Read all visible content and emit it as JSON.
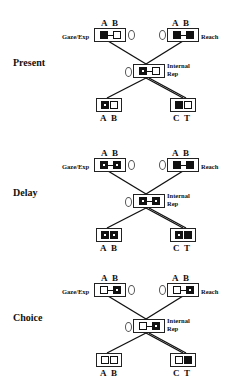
{
  "panels": [
    {
      "phase": "Present",
      "gaze": {
        "label": "Gaze/Exp",
        "letters": [
          "A",
          "B"
        ],
        "cells": [
          "filled",
          "hollow"
        ],
        "connected": true
      },
      "reach": {
        "label": "Reach",
        "letters": [
          "A",
          "B"
        ],
        "cells": [
          "filled",
          "filled"
        ],
        "connected": true
      },
      "internal": {
        "label_line1": "Internal",
        "label_line2": "Rep",
        "cells": [
          "filled-dot",
          "hollow"
        ],
        "connected": true
      },
      "bottom_left": {
        "letters": [
          "A",
          "B"
        ],
        "cells": [
          "filled-dot",
          "hollow"
        ]
      },
      "bottom_right": {
        "letters": [
          "C",
          "T"
        ],
        "cells": [
          "filled",
          "hollow"
        ]
      }
    },
    {
      "phase": "Delay",
      "gaze": {
        "label": "Gaze/Exp",
        "letters": [
          "A",
          "B"
        ],
        "cells": [
          "filled-dot",
          "filled-dot"
        ],
        "connected": true
      },
      "reach": {
        "label": "Reach",
        "letters": [
          "A",
          "B"
        ],
        "cells": [
          "filled",
          "filled"
        ],
        "connected": true
      },
      "internal": {
        "label_line1": "Internal",
        "label_line2": "Rep",
        "cells": [
          "filled-dot",
          "filled-dot"
        ],
        "connected": true
      },
      "bottom_left": {
        "letters": [
          "A",
          "B"
        ],
        "cells": [
          "filled-dot",
          "filled-dot"
        ]
      },
      "bottom_right": {
        "letters": [
          "C",
          "T"
        ],
        "cells": [
          "filled-dot",
          "filled"
        ]
      }
    },
    {
      "phase": "Choice",
      "gaze": {
        "label": "Gaze/Exp",
        "letters": [
          "A",
          "B"
        ],
        "cells": [
          "hollow",
          "filled-dot"
        ],
        "connected": true
      },
      "reach": {
        "label": "Reach",
        "letters": [
          "A",
          "B"
        ],
        "cells": [
          "hollow",
          "filled-dot"
        ],
        "connected": true
      },
      "internal": {
        "label_line1": "Internal",
        "label_line2": "Rep",
        "cells": [
          "hollow",
          "filled-dot"
        ],
        "connected": true
      },
      "bottom_left": {
        "letters": [
          "A",
          "B"
        ],
        "cells": [
          "hollow",
          "hollow"
        ]
      },
      "bottom_right": {
        "letters": [
          "C",
          "T"
        ],
        "cells": [
          "hollow",
          "filled"
        ]
      }
    }
  ]
}
